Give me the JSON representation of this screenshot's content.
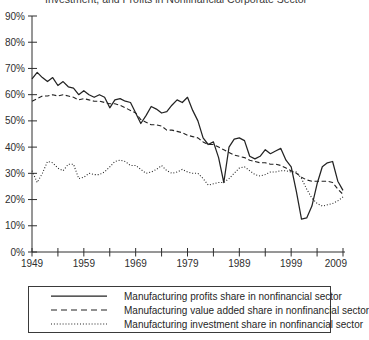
{
  "title": "Investment, and Profits in Nonfinancial Corporate Sector",
  "chart_data": {
    "type": "line",
    "title": "Investment, and Profits in Nonfinancial Corporate Sector",
    "xlabel": "",
    "ylabel": "",
    "xlim": [
      1949,
      2009
    ],
    "ylim": [
      0,
      90
    ],
    "grid": false,
    "legend_position": "bottom",
    "line_color": "#232323",
    "xtick_labels": [
      "1949",
      "1959",
      "1969",
      "1979",
      "1989",
      "1999",
      "2009"
    ],
    "minor_xtick_step_years": 5,
    "ytick_labels": [
      "0%",
      "10%",
      "20%",
      "30%",
      "40%",
      "50%",
      "60%",
      "70%",
      "80%",
      "90%"
    ],
    "x": [
      1949,
      1950,
      1951,
      1952,
      1953,
      1954,
      1955,
      1956,
      1957,
      1958,
      1959,
      1960,
      1961,
      1962,
      1963,
      1964,
      1965,
      1966,
      1967,
      1968,
      1969,
      1970,
      1971,
      1972,
      1973,
      1974,
      1975,
      1976,
      1977,
      1978,
      1979,
      1980,
      1981,
      1982,
      1983,
      1984,
      1985,
      1986,
      1987,
      1988,
      1989,
      1990,
      1991,
      1992,
      1993,
      1994,
      1995,
      1996,
      1997,
      1998,
      1999,
      2000,
      2001,
      2002,
      2003,
      2004,
      2005,
      2006,
      2007,
      2008,
      2009
    ],
    "series": [
      {
        "name": "Manufacturing profits share in nonfinancial sector",
        "style": "solid",
        "values": [
          66,
          68.5,
          66.5,
          65,
          66.5,
          63.5,
          65,
          63,
          62.5,
          60,
          61.5,
          60,
          59,
          60,
          59,
          55,
          58,
          58.5,
          57.5,
          57,
          53,
          49,
          52,
          55.5,
          54.5,
          53,
          53.5,
          56,
          58,
          57,
          59,
          54,
          50,
          43.5,
          41,
          42,
          36,
          26.5,
          40,
          43,
          43.5,
          42.5,
          36.5,
          35.5,
          36.5,
          39,
          37.5,
          38.5,
          39.5,
          35,
          32.5,
          23,
          12.5,
          13,
          17.5,
          26,
          32.5,
          34,
          34.5,
          27,
          23.5
        ]
      },
      {
        "name": "Manufacturing value added share in nonfinancial sector",
        "style": "dashed",
        "values": [
          57.5,
          58.5,
          59.5,
          59.5,
          60,
          59.5,
          60,
          59.5,
          59,
          58,
          58.5,
          58,
          57.5,
          57.5,
          57,
          56.5,
          56.5,
          56,
          55,
          54,
          53,
          50.5,
          49.5,
          48.5,
          48.5,
          48,
          46.5,
          46.5,
          46,
          45.5,
          44.5,
          44,
          43.5,
          42,
          41,
          41,
          40,
          39,
          38,
          37,
          36.5,
          36,
          35,
          34.5,
          34,
          34,
          33.5,
          33.5,
          33,
          32,
          31,
          30,
          28.5,
          27.5,
          27,
          27,
          27,
          27,
          26.5,
          24,
          22
        ]
      },
      {
        "name": "Manufacturing investment share in nonfinancial sector",
        "style": "dotted",
        "values": [
          31,
          26.5,
          30,
          34.5,
          34,
          32,
          31,
          33.5,
          33.5,
          28,
          28.5,
          30,
          29.5,
          29.5,
          30.5,
          32.5,
          34.5,
          35,
          34.5,
          33,
          33,
          31.5,
          30,
          30.5,
          31.5,
          33,
          31,
          30,
          30.5,
          31.5,
          30.5,
          30,
          30,
          28,
          25.5,
          26,
          26.5,
          26.5,
          28,
          30,
          32,
          32.5,
          31,
          29.5,
          29,
          29.5,
          30.5,
          30.5,
          31,
          31,
          30.5,
          30.5,
          28,
          24,
          20.5,
          18.5,
          17.5,
          18,
          18.5,
          19.5,
          21
        ]
      }
    ]
  }
}
